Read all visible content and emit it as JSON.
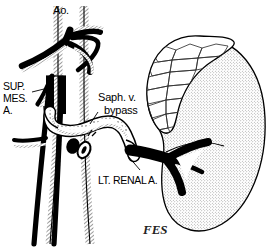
{
  "figure": {
    "width": 277,
    "height": 248,
    "background_color": "#ffffff",
    "ink_color": "#000000",
    "stipple_color": "#6e6e6e"
  },
  "labels": {
    "aorta": "Ao.",
    "sup_mes_a_line1": "SUP.",
    "sup_mes_a_line2": "MES.",
    "sup_mes_a_line3": "A.",
    "saph_v_line1": "Saph. v.",
    "saph_v_line2": "bypass",
    "lt_renal_a": "LT. RENAL A.",
    "signature": "FES"
  },
  "structures": [
    {
      "name": "aorta",
      "label": "Ao.",
      "rendering": "hatched-tube-vertical"
    },
    {
      "name": "celiac-trunk",
      "label": "",
      "rendering": "solid-black-vessel"
    },
    {
      "name": "superior-mesenteric-artery",
      "label": "SUP. MES. A.",
      "rendering": "solid-black-vessel"
    },
    {
      "name": "saphenous-vein-bypass-graft",
      "label": "Saph. v. bypass",
      "rendering": "white-tube-with-suture-stipple"
    },
    {
      "name": "left-renal-artery",
      "label": "LT. RENAL A.",
      "rendering": "solid-black-branching-vessel"
    },
    {
      "name": "left-kidney",
      "label": "",
      "rendering": "stipple-filled-bean"
    },
    {
      "name": "left-adrenal-gland",
      "label": "",
      "rendering": "cobblestone-texture-cap"
    },
    {
      "name": "ligated-stump",
      "label": "",
      "rendering": "small-black-oval"
    }
  ]
}
